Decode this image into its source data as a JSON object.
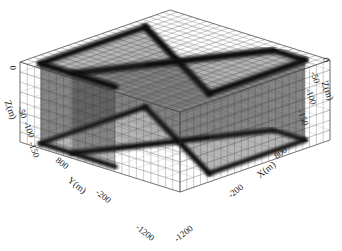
{
  "chart_data": {
    "type": "3d-mesh",
    "title": "",
    "axes": {
      "x": {
        "label": "X(m)",
        "ticks": [
          "-200",
          "800"
        ],
        "range": [
          -1200,
          1200
        ]
      },
      "y": {
        "label": "Y(m)",
        "ticks": [
          "800",
          "-200",
          "-1200"
        ],
        "range": [
          -1200,
          1200
        ]
      },
      "z": {
        "label": "Z(m)",
        "ticks": [
          "0",
          "-50",
          "-100",
          "-150"
        ],
        "range": [
          -150,
          0
        ]
      },
      "z_right": {
        "label": "Z(m)",
        "ticks": [
          "0",
          "-50",
          "-100",
          "-150"
        ]
      },
      "extra_ticks": [
        "-1200",
        "-1200"
      ]
    },
    "grid": true,
    "colors": {
      "mesh": "#555555",
      "dense": "#111111",
      "background": "#ffffff"
    }
  },
  "labels": {
    "z_left": {
      "t0": "0",
      "t1": "-50",
      "t2": "-100",
      "t3": "-150",
      "title": "Z(m)"
    },
    "z_right": {
      "t0": "0",
      "t1": "-50",
      "t2": "-100",
      "t3": "-150",
      "title": "Z(m)"
    },
    "y": {
      "t0": "800",
      "t1": "-200",
      "t2": "-1200",
      "title": "Y(m)"
    },
    "x": {
      "t0": "800",
      "t1": "-200",
      "t2": "-1200",
      "title": "X(m)"
    }
  }
}
